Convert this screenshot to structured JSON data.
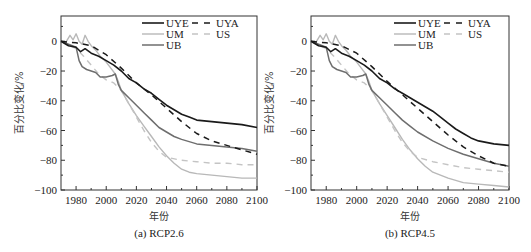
{
  "figure": {
    "panels": [
      {
        "caption": "(a) RCP2.6",
        "xlabel": "年份",
        "ylabel": "百分比变化/%"
      },
      {
        "caption": "(b) RCP4.5",
        "xlabel": "年份",
        "ylabel": "百分比变化/%"
      }
    ]
  },
  "chart_data": [
    {
      "type": "line",
      "title": "(a) RCP2.6",
      "xlabel": "年份",
      "ylabel": "百分比变化/%",
      "xlim": [
        1970,
        2100
      ],
      "ylim": [
        -100,
        17
      ],
      "xticks": [
        1980,
        2000,
        2020,
        2040,
        2060,
        2080,
        2100
      ],
      "yticks": [
        0,
        -20,
        -40,
        -60,
        -80,
        -100
      ],
      "grid": false,
      "legend_position": "upper right",
      "series": [
        {
          "name": "UYE",
          "style": "solid",
          "color": "#1a1a1a",
          "width": 1.6,
          "x": [
            1970,
            1975,
            1980,
            1983,
            1986,
            1990,
            1995,
            2000,
            2005,
            2010,
            2015,
            2020,
            2025,
            2030,
            2035,
            2040,
            2045,
            2050,
            2055,
            2060,
            2070,
            2080,
            2090,
            2100
          ],
          "y": [
            0,
            -3,
            -4,
            -7,
            -5,
            -8,
            -10,
            -13,
            -16,
            -20,
            -25,
            -28,
            -32,
            -35,
            -39,
            -43,
            -46,
            -49,
            -51,
            -53,
            -54,
            -55,
            -56,
            -58
          ]
        },
        {
          "name": "UYA",
          "style": "dashed",
          "color": "#1a1a1a",
          "width": 1.5,
          "x": [
            1970,
            1980,
            1990,
            2000,
            2010,
            2020,
            2030,
            2040,
            2050,
            2060,
            2070,
            2080,
            2090,
            2100
          ],
          "y": [
            0,
            -1,
            -3,
            -9,
            -18,
            -28,
            -36,
            -45,
            -54,
            -62,
            -67,
            -70,
            -73,
            -76
          ]
        },
        {
          "name": "UM",
          "style": "solid",
          "color": "#b8b8b8",
          "width": 1.4,
          "x": [
            1970,
            1973,
            1976,
            1978,
            1980,
            1982,
            1984,
            1986,
            1988,
            1990,
            1993,
            1996,
            2000,
            2003,
            2006,
            2008,
            2010,
            2015,
            2020,
            2025,
            2030,
            2035,
            2040,
            2045,
            2050,
            2055,
            2060,
            2070,
            2080,
            2090,
            2100
          ],
          "y": [
            0,
            -1,
            4,
            1,
            5,
            0,
            -2,
            4,
            0,
            -3,
            -6,
            -10,
            -14,
            -18,
            -22,
            -27,
            -33,
            -42,
            -50,
            -57,
            -64,
            -71,
            -77,
            -82,
            -86,
            -88,
            -89,
            -90,
            -91,
            -92,
            -92
          ]
        },
        {
          "name": "US",
          "style": "dashed",
          "color": "#c4c4c4",
          "width": 1.4,
          "x": [
            1970,
            1980,
            1985,
            1990,
            1995,
            2000,
            2005,
            2010,
            2015,
            2020,
            2025,
            2030,
            2035,
            2040,
            2050,
            2060,
            2070,
            2080,
            2090,
            2100
          ],
          "y": [
            0,
            -5,
            -10,
            -16,
            -22,
            -26,
            -28,
            -33,
            -42,
            -51,
            -60,
            -68,
            -74,
            -78,
            -80,
            -81,
            -82,
            -82,
            -83,
            -83
          ]
        },
        {
          "name": "UB",
          "style": "solid",
          "color": "#6e6e6e",
          "width": 1.5,
          "x": [
            1970,
            1975,
            1980,
            1982,
            1984,
            1987,
            1990,
            1993,
            1996,
            2000,
            2004,
            2006,
            2008,
            2010,
            2015,
            2020,
            2025,
            2030,
            2035,
            2040,
            2045,
            2050,
            2060,
            2070,
            2080,
            2090,
            2100
          ],
          "y": [
            0,
            -2,
            -4,
            -13,
            -17,
            -19,
            -20,
            -21,
            -24,
            -24,
            -23,
            -22,
            -29,
            -33,
            -38,
            -43,
            -48,
            -53,
            -58,
            -61,
            -64,
            -66,
            -69,
            -70,
            -71,
            -72,
            -74
          ]
        }
      ]
    },
    {
      "type": "line",
      "title": "(b) RCP4.5",
      "xlabel": "年份",
      "ylabel": "百分比变化/%",
      "xlim": [
        1970,
        2100
      ],
      "ylim": [
        -100,
        17
      ],
      "xticks": [
        1980,
        2000,
        2020,
        2040,
        2060,
        2080,
        2100
      ],
      "yticks": [
        0,
        -20,
        -40,
        -60,
        -80,
        -100
      ],
      "grid": false,
      "legend_position": "upper right",
      "series": [
        {
          "name": "UYE",
          "style": "solid",
          "color": "#1a1a1a",
          "width": 1.6,
          "x": [
            1970,
            1975,
            1980,
            1983,
            1986,
            1990,
            1995,
            2000,
            2005,
            2010,
            2015,
            2020,
            2025,
            2030,
            2035,
            2040,
            2045,
            2050,
            2055,
            2060,
            2065,
            2070,
            2075,
            2080,
            2090,
            2100
          ],
          "y": [
            0,
            -3,
            -4,
            -7,
            -5,
            -8,
            -10,
            -13,
            -16,
            -20,
            -25,
            -28,
            -32,
            -35,
            -38,
            -41,
            -44,
            -47,
            -51,
            -55,
            -59,
            -62,
            -65,
            -67,
            -69,
            -70
          ]
        },
        {
          "name": "UYA",
          "style": "dashed",
          "color": "#1a1a1a",
          "width": 1.5,
          "x": [
            1970,
            1980,
            1990,
            2000,
            2010,
            2020,
            2030,
            2040,
            2050,
            2060,
            2070,
            2080,
            2090,
            2100
          ],
          "y": [
            0,
            -1,
            -3,
            -8,
            -17,
            -27,
            -36,
            -45,
            -54,
            -63,
            -71,
            -77,
            -82,
            -84
          ]
        },
        {
          "name": "UM",
          "style": "solid",
          "color": "#b8b8b8",
          "width": 1.4,
          "x": [
            1970,
            1973,
            1976,
            1978,
            1980,
            1982,
            1984,
            1986,
            1988,
            1990,
            1993,
            1996,
            2000,
            2003,
            2006,
            2008,
            2010,
            2015,
            2020,
            2025,
            2030,
            2035,
            2040,
            2045,
            2050,
            2060,
            2070,
            2080,
            2090,
            2100
          ],
          "y": [
            0,
            -1,
            4,
            1,
            5,
            0,
            -2,
            4,
            0,
            -3,
            -6,
            -10,
            -14,
            -18,
            -22,
            -27,
            -33,
            -42,
            -50,
            -58,
            -66,
            -73,
            -79,
            -84,
            -88,
            -92,
            -95,
            -96,
            -97,
            -98
          ]
        },
        {
          "name": "US",
          "style": "dashed",
          "color": "#c4c4c4",
          "width": 1.4,
          "x": [
            1970,
            1980,
            1985,
            1990,
            1995,
            2000,
            2005,
            2010,
            2015,
            2020,
            2025,
            2030,
            2035,
            2040,
            2050,
            2060,
            2070,
            2080,
            2090,
            2100
          ],
          "y": [
            0,
            -5,
            -10,
            -16,
            -22,
            -26,
            -28,
            -33,
            -42,
            -51,
            -60,
            -68,
            -74,
            -78,
            -81,
            -83,
            -85,
            -86,
            -87,
            -88
          ]
        },
        {
          "name": "UB",
          "style": "solid",
          "color": "#6e6e6e",
          "width": 1.5,
          "x": [
            1970,
            1975,
            1980,
            1982,
            1984,
            1987,
            1990,
            1993,
            1996,
            2000,
            2004,
            2006,
            2008,
            2010,
            2015,
            2020,
            2025,
            2030,
            2035,
            2040,
            2050,
            2060,
            2070,
            2080,
            2090,
            2100
          ],
          "y": [
            0,
            -2,
            -4,
            -13,
            -17,
            -19,
            -20,
            -21,
            -24,
            -24,
            -23,
            -22,
            -29,
            -33,
            -38,
            -43,
            -48,
            -53,
            -57,
            -61,
            -67,
            -72,
            -76,
            -79,
            -82,
            -84
          ]
        }
      ]
    }
  ]
}
